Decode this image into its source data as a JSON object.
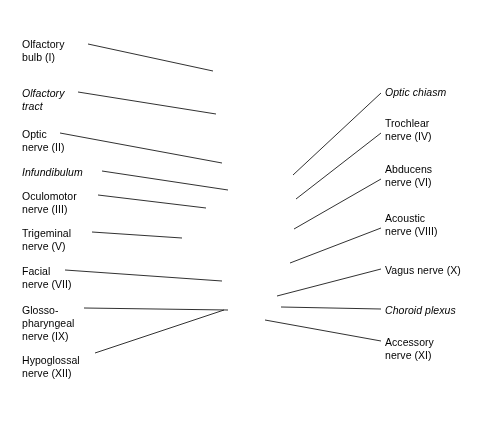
{
  "figure": {
    "background_color": "#ffffff",
    "ink_color": "#1a1a1a",
    "tissue_color": "#b9bcbd"
  },
  "labels_left": [
    {
      "id": "olfactory-bulb",
      "text": "Olfactory\nbulb (I)",
      "italic": false,
      "x": 22,
      "y": 38,
      "line": {
        "x1": 88,
        "y1": 44,
        "x2": 213,
        "y2": 71
      }
    },
    {
      "id": "olfactory-tract",
      "text": "Olfactory\ntract",
      "italic": true,
      "x": 22,
      "y": 87,
      "line": {
        "x1": 78,
        "y1": 92,
        "x2": 216,
        "y2": 114
      }
    },
    {
      "id": "optic-nerve",
      "text": "Optic\nnerve (II)",
      "italic": false,
      "x": 22,
      "y": 128,
      "line": {
        "x1": 60,
        "y1": 133,
        "x2": 222,
        "y2": 163
      }
    },
    {
      "id": "infundibulum",
      "text": "Infundibulum",
      "italic": true,
      "x": 22,
      "y": 166,
      "line": {
        "x1": 102,
        "y1": 171,
        "x2": 228,
        "y2": 190
      }
    },
    {
      "id": "oculomotor-nerve",
      "text": "Oculomotor\nnerve (III)",
      "italic": false,
      "x": 22,
      "y": 190,
      "line": {
        "x1": 98,
        "y1": 195,
        "x2": 206,
        "y2": 208
      }
    },
    {
      "id": "trigeminal-nerve",
      "text": "Trigeminal\nnerve (V)",
      "italic": false,
      "x": 22,
      "y": 227,
      "line": {
        "x1": 92,
        "y1": 232,
        "x2": 182,
        "y2": 238
      }
    },
    {
      "id": "facial-nerve",
      "text": "Facial\nnerve (VII)",
      "italic": false,
      "x": 22,
      "y": 265,
      "line": {
        "x1": 65,
        "y1": 270,
        "x2": 222,
        "y2": 281
      }
    },
    {
      "id": "glossopharyngeal",
      "text": "Glosso-\npharyngeal\nnerve (IX)",
      "italic": false,
      "x": 22,
      "y": 304,
      "line": {
        "x1": 84,
        "y1": 308,
        "x2": 228,
        "y2": 310
      }
    },
    {
      "id": "hypoglossal-nerve",
      "text": "Hypoglossal\nnerve (XII)",
      "italic": false,
      "x": 22,
      "y": 354,
      "line": {
        "x1": 95,
        "y1": 353,
        "x2": 224,
        "y2": 310
      }
    }
  ],
  "labels_right": [
    {
      "id": "optic-chiasm",
      "text": "Optic chiasm",
      "italic": true,
      "x": 385,
      "y": 86,
      "line": {
        "x1": 381,
        "y1": 93,
        "x2": 293,
        "y2": 175
      }
    },
    {
      "id": "trochlear-nerve",
      "text": "Trochlear\nnerve (IV)",
      "italic": false,
      "x": 385,
      "y": 117,
      "line": {
        "x1": 381,
        "y1": 133,
        "x2": 296,
        "y2": 199
      }
    },
    {
      "id": "abducens-nerve",
      "text": "Abducens\nnerve (VI)",
      "italic": false,
      "x": 385,
      "y": 163,
      "line": {
        "x1": 381,
        "y1": 179,
        "x2": 294,
        "y2": 229
      }
    },
    {
      "id": "acoustic-nerve",
      "text": "Acoustic\nnerve (VIII)",
      "italic": false,
      "x": 385,
      "y": 212,
      "line": {
        "x1": 381,
        "y1": 228,
        "x2": 290,
        "y2": 263
      }
    },
    {
      "id": "vagus-nerve",
      "text": "Vagus nerve (X)",
      "italic": false,
      "x": 385,
      "y": 264,
      "line": {
        "x1": 381,
        "y1": 269,
        "x2": 277,
        "y2": 296
      }
    },
    {
      "id": "choroid-plexus",
      "text": "Choroid plexus",
      "italic": true,
      "x": 385,
      "y": 304,
      "line": {
        "x1": 381,
        "y1": 309,
        "x2": 281,
        "y2": 307
      }
    },
    {
      "id": "accessory-nerve",
      "text": "Accessory\nnerve (XI)",
      "italic": false,
      "x": 385,
      "y": 336,
      "line": {
        "x1": 381,
        "y1": 341,
        "x2": 265,
        "y2": 320
      }
    }
  ]
}
